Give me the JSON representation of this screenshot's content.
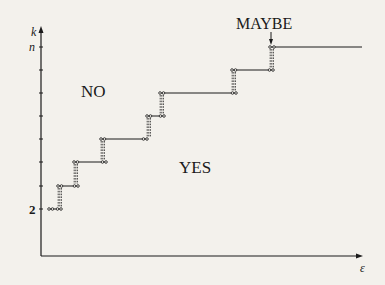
{
  "figure": {
    "y_axis": {
      "label": "k",
      "ticks": [
        {
          "label": "n",
          "y": 46
        },
        {
          "label": "2",
          "y": 209
        }
      ]
    },
    "x_axis": {
      "label": "ε"
    },
    "regions": {
      "no": "NO",
      "yes": "YES",
      "maybe": "MAYBE"
    },
    "steps": [
      {
        "x1": 49,
        "x2": 61,
        "y": 209
      },
      {
        "x1": 58,
        "x2": 78,
        "y": 186
      },
      {
        "x1": 74,
        "x2": 106,
        "y": 162
      },
      {
        "x1": 101,
        "x2": 147,
        "y": 139
      },
      {
        "x1": 147,
        "x2": 164,
        "y": 116
      },
      {
        "x1": 160,
        "x2": 236,
        "y": 93
      },
      {
        "x1": 232,
        "x2": 273,
        "y": 70
      },
      {
        "x1": 270,
        "x2": 362,
        "y": 47
      }
    ],
    "colors": {
      "ink": "#1a1a1a",
      "paper": "#f3f1ec",
      "bleed_text": "#d9d6d0"
    }
  }
}
